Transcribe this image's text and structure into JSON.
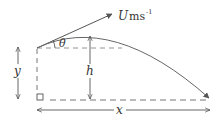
{
  "diagram": {
    "labels": {
      "velocity_symbol": "U",
      "velocity_unit": "ms",
      "velocity_unit_exp": "-1",
      "angle": "θ",
      "height_above_ground": "h",
      "launch_height": "y",
      "horizontal_range": "x"
    },
    "colors": {
      "line": "#555555",
      "dashed": "#777777",
      "text": "#333333"
    },
    "elements": [
      {
        "type": "velocity-vector",
        "label": "U ms-1"
      },
      {
        "type": "angle-marker",
        "label": "θ"
      },
      {
        "type": "trajectory-curve"
      },
      {
        "type": "dimension-arrow",
        "label": "h"
      },
      {
        "type": "dimension-arrow",
        "label": "y"
      },
      {
        "type": "dimension-arrow",
        "label": "x"
      },
      {
        "type": "right-angle-marker"
      }
    ]
  }
}
